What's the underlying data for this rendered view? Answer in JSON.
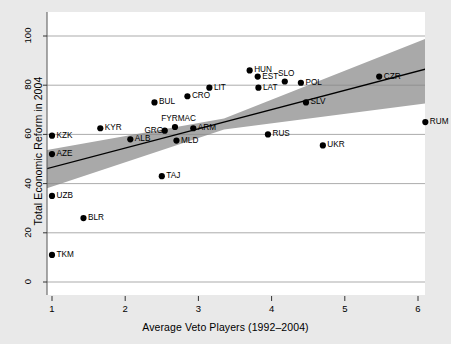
{
  "chart_data": {
    "type": "scatter",
    "title": "",
    "xlabel": "Average Veto Players (1992–2004)",
    "ylabel": "Total Economic Reform in 2004",
    "xlim": [
      0.72,
      6.33
    ],
    "ylim": [
      -4,
      105
    ],
    "xticks": [
      1,
      2,
      3,
      4,
      5,
      6
    ],
    "yticks": [
      0,
      20,
      40,
      60,
      80,
      100
    ],
    "xtick_labels": [
      "1",
      "2",
      "3",
      "4",
      "5",
      "6"
    ],
    "ytick_labels": [
      "0",
      "20",
      "40",
      "60",
      "80",
      "100"
    ],
    "grid": "horizontal",
    "legend": "none",
    "points": [
      {
        "label": "TKM",
        "x": 1.0,
        "y": 11.0,
        "label_side": "right"
      },
      {
        "label": "UZB",
        "x": 1.0,
        "y": 35.0,
        "label_side": "right"
      },
      {
        "label": "AZE",
        "x": 1.0,
        "y": 52.0,
        "label_side": "right"
      },
      {
        "label": "KZK",
        "x": 1.0,
        "y": 59.5,
        "label_side": "right"
      },
      {
        "label": "BLR",
        "x": 1.43,
        "y": 26.0,
        "label_side": "right"
      },
      {
        "label": "KYR",
        "x": 1.66,
        "y": 62.5,
        "label_side": "right"
      },
      {
        "label": "ALB",
        "x": 2.07,
        "y": 58.0,
        "label_side": "right"
      },
      {
        "label": "BUL",
        "x": 2.4,
        "y": 73.0,
        "label_side": "right"
      },
      {
        "label": "TAJ",
        "x": 2.5,
        "y": 43.0,
        "label_side": "right"
      },
      {
        "label": "GRG",
        "x": 2.54,
        "y": 61.5,
        "label_side": "left"
      },
      {
        "label": "FYRMAC",
        "x": 2.68,
        "y": 63.0,
        "label_side": "above"
      },
      {
        "label": "MLD",
        "x": 2.7,
        "y": 57.5,
        "label_side": "right"
      },
      {
        "label": "CRO",
        "x": 2.85,
        "y": 75.5,
        "label_side": "right"
      },
      {
        "label": "ARM",
        "x": 2.93,
        "y": 62.5,
        "label_side": "right"
      },
      {
        "label": "LIT",
        "x": 3.15,
        "y": 79.0,
        "label_side": "right"
      },
      {
        "label": "HUN",
        "x": 3.7,
        "y": 86.0,
        "label_side": "right"
      },
      {
        "label": "EST",
        "x": 3.81,
        "y": 83.5,
        "label_side": "right"
      },
      {
        "label": "LAT",
        "x": 3.82,
        "y": 79.0,
        "label_side": "right"
      },
      {
        "label": "RUS",
        "x": 3.95,
        "y": 60.0,
        "label_side": "right"
      },
      {
        "label": "SLO",
        "x": 4.18,
        "y": 81.5,
        "label_side": "above"
      },
      {
        "label": "POL",
        "x": 4.4,
        "y": 81.0,
        "label_side": "right"
      },
      {
        "label": "SLV",
        "x": 4.47,
        "y": 73.0,
        "label_side": "right"
      },
      {
        "label": "UKR",
        "x": 4.7,
        "y": 55.5,
        "label_side": "right"
      },
      {
        "label": "CZR",
        "x": 5.47,
        "y": 83.5,
        "label_side": "right"
      },
      {
        "label": "RUM",
        "x": 6.1,
        "y": 65.0,
        "label_side": "right"
      }
    ],
    "fit_line": {
      "x_start": 0.72,
      "y_start": 44.4,
      "x_end": 6.33,
      "y_end": 88.3
    },
    "confidence_band": {
      "x_start": 0.72,
      "upper_start": 52.5,
      "lower_start": 36.0,
      "x_end": 6.33,
      "upper_end": 101.5,
      "lower_end": 73.5,
      "x_mid": 3.35,
      "upper_mid": 66.5,
      "lower_mid": 62.0,
      "color": "#a9a9a9"
    },
    "marker_color": "#000000",
    "line_color": "#000000",
    "background_color": "#e9e9e9",
    "canvas_color": "#ffffff",
    "grid_color": "#888888"
  }
}
